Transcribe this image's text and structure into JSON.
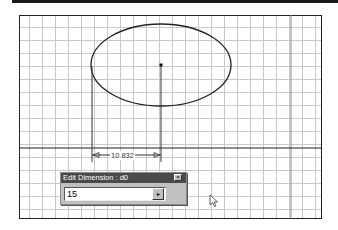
{
  "canvas": {
    "background": "#ffffff",
    "grid_color": "#c8c8c8",
    "grid_spacing_px": 13
  },
  "sketch": {
    "ellipse": {
      "cx": 161,
      "cy": 65,
      "rx": 70,
      "ry": 41
    },
    "center_point": {
      "x": 161,
      "y": 65
    }
  },
  "dimension": {
    "name": "d0",
    "value_label": "10.832"
  },
  "dialog": {
    "title": "Edit Dimension : d0",
    "close_glyph": "×",
    "input_value": "15",
    "apply_glyph": "▸"
  },
  "icons": {
    "cursor": "mouse-pointer-icon",
    "close": "close-icon",
    "apply": "arrow-right-icon"
  }
}
